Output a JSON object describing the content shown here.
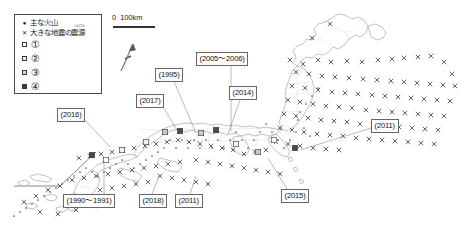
{
  "legend": {
    "title_hidden": "",
    "items": [
      {
        "symbol": "dot",
        "icon": "volcano-dot-icon",
        "label": "主な火山",
        "furigana": ""
      },
      {
        "symbol": "cross",
        "icon": "earthquake-cross-icon",
        "label": "大きな地震の震源",
        "furigana": "しんげん"
      }
    ],
    "ranks": [
      {
        "icon": "square-rank-1-icon",
        "label": "①",
        "fill": "#ffffff"
      },
      {
        "icon": "square-rank-2-icon",
        "label": "②",
        "fill": "#f2f2f2"
      },
      {
        "icon": "square-rank-3-icon",
        "label": "③",
        "fill": "#d8d8d8"
      },
      {
        "icon": "square-rank-4-icon",
        "label": "④",
        "fill": "#3a3a3a"
      }
    ]
  },
  "scale": {
    "zero": "0",
    "distance": "100km"
  },
  "north_arrow": {
    "icon": "north-arrow-icon",
    "label": ""
  },
  "callouts": [
    {
      "id": "c2005",
      "label": "(2005〜2006)",
      "left": 196,
      "top": 52,
      "leader": {
        "x1": 231,
        "y1": 63,
        "x2": 231,
        "y2": 131
      }
    },
    {
      "id": "c1995",
      "label": "(1995)",
      "left": 155,
      "top": 68,
      "leader": {
        "x1": 173,
        "y1": 79,
        "x2": 196,
        "y2": 133
      }
    },
    {
      "id": "c2014",
      "label": "(2014)",
      "left": 229,
      "top": 86,
      "leader": {
        "x1": 241,
        "y1": 97,
        "x2": 228,
        "y2": 134
      }
    },
    {
      "id": "c2017",
      "label": "(2017)",
      "left": 136,
      "top": 94,
      "leader": {
        "x1": 162,
        "y1": 105,
        "x2": 178,
        "y2": 132
      }
    },
    {
      "id": "c2016",
      "label": "(2016)",
      "left": 57,
      "top": 108,
      "leader": {
        "x1": 84,
        "y1": 119,
        "x2": 110,
        "y2": 147
      }
    },
    {
      "id": "c2011r",
      "label": "(2011)",
      "left": 371,
      "top": 119,
      "leader": {
        "x1": 371,
        "y1": 128,
        "x2": 300,
        "y2": 150
      }
    },
    {
      "id": "c1990",
      "label": "(1990〜1991)",
      "left": 63,
      "top": 194,
      "leader": {
        "x1": 104,
        "y1": 194,
        "x2": 104,
        "y2": 162
      }
    },
    {
      "id": "c2018",
      "label": "(2018)",
      "left": 139,
      "top": 194,
      "leader": {
        "x1": 152,
        "y1": 194,
        "x2": 159,
        "y2": 176
      }
    },
    {
      "id": "c2011b",
      "label": "(2011)",
      "left": 175,
      "top": 194,
      "leader": {
        "x1": 190,
        "y1": 194,
        "x2": 196,
        "y2": 176
      }
    },
    {
      "id": "c2015",
      "label": "(2015)",
      "left": 281,
      "top": 189,
      "leader": {
        "x1": 287,
        "y1": 189,
        "x2": 268,
        "y2": 158
      }
    }
  ],
  "colors": {
    "coastline": "#8a8a8a",
    "prefecture_border": "#a8a8a8",
    "quake_mark": "#333333",
    "volcano_mark": "#555555",
    "label_border": "#666666",
    "background": "#ffffff"
  },
  "map_data": {
    "type": "thematic-point-map",
    "region": "Japan",
    "earthquake_epicenters": [
      [
        330,
        24
      ],
      [
        312,
        38
      ],
      [
        290,
        60
      ],
      [
        303,
        64
      ],
      [
        318,
        60
      ],
      [
        331,
        62
      ],
      [
        347,
        61
      ],
      [
        362,
        62
      ],
      [
        378,
        60
      ],
      [
        392,
        59
      ],
      [
        404,
        58
      ],
      [
        418,
        57
      ],
      [
        431,
        56
      ],
      [
        444,
        62
      ],
      [
        452,
        74
      ],
      [
        296,
        72
      ],
      [
        309,
        74
      ],
      [
        322,
        76
      ],
      [
        335,
        77
      ],
      [
        349,
        78
      ],
      [
        363,
        79
      ],
      [
        377,
        80
      ],
      [
        391,
        81
      ],
      [
        404,
        82
      ],
      [
        417,
        83
      ],
      [
        430,
        84
      ],
      [
        443,
        85
      ],
      [
        455,
        86
      ],
      [
        292,
        86
      ],
      [
        305,
        88
      ],
      [
        318,
        90
      ],
      [
        332,
        92
      ],
      [
        345,
        93
      ],
      [
        358,
        94
      ],
      [
        372,
        95
      ],
      [
        385,
        96
      ],
      [
        398,
        97
      ],
      [
        411,
        98
      ],
      [
        424,
        99
      ],
      [
        437,
        100
      ],
      [
        450,
        101
      ],
      [
        288,
        100
      ],
      [
        300,
        102
      ],
      [
        313,
        104
      ],
      [
        326,
        106
      ],
      [
        339,
        107
      ],
      [
        352,
        108
      ],
      [
        366,
        110
      ],
      [
        379,
        111
      ],
      [
        392,
        112
      ],
      [
        405,
        113
      ],
      [
        418,
        114
      ],
      [
        431,
        115
      ],
      [
        444,
        116
      ],
      [
        284,
        114
      ],
      [
        296,
        116
      ],
      [
        308,
        118
      ],
      [
        321,
        120
      ],
      [
        334,
        121
      ],
      [
        347,
        122
      ],
      [
        360,
        124
      ],
      [
        373,
        125
      ],
      [
        386,
        126
      ],
      [
        399,
        127
      ],
      [
        412,
        128
      ],
      [
        425,
        129
      ],
      [
        438,
        130
      ],
      [
        280,
        128
      ],
      [
        292,
        130
      ],
      [
        304,
        132
      ],
      [
        317,
        134
      ],
      [
        330,
        135
      ],
      [
        343,
        136
      ],
      [
        356,
        138
      ],
      [
        369,
        139
      ],
      [
        382,
        140
      ],
      [
        395,
        141
      ],
      [
        408,
        142
      ],
      [
        421,
        143
      ],
      [
        434,
        144
      ],
      [
        276,
        142
      ],
      [
        288,
        144
      ],
      [
        300,
        146
      ],
      [
        313,
        148
      ],
      [
        326,
        149
      ],
      [
        339,
        150
      ],
      [
        266,
        150
      ],
      [
        255,
        152
      ],
      [
        244,
        154
      ],
      [
        233,
        150
      ],
      [
        222,
        148
      ],
      [
        211,
        146
      ],
      [
        200,
        144
      ],
      [
        189,
        142
      ],
      [
        178,
        140
      ],
      [
        167,
        142
      ],
      [
        156,
        144
      ],
      [
        145,
        146
      ],
      [
        134,
        148
      ],
      [
        123,
        150
      ],
      [
        112,
        152
      ],
      [
        101,
        154
      ],
      [
        90,
        156
      ],
      [
        79,
        158
      ],
      [
        196,
        160
      ],
      [
        208,
        162
      ],
      [
        220,
        164
      ],
      [
        232,
        166
      ],
      [
        244,
        168
      ],
      [
        256,
        170
      ],
      [
        268,
        172
      ],
      [
        280,
        174
      ],
      [
        180,
        162
      ],
      [
        168,
        164
      ],
      [
        156,
        166
      ],
      [
        144,
        168
      ],
      [
        132,
        170
      ],
      [
        120,
        172
      ],
      [
        108,
        174
      ],
      [
        96,
        176
      ],
      [
        84,
        178
      ],
      [
        72,
        180
      ],
      [
        160,
        176
      ],
      [
        172,
        178
      ],
      [
        184,
        180
      ],
      [
        196,
        182
      ],
      [
        208,
        184
      ],
      [
        148,
        182
      ],
      [
        136,
        184
      ],
      [
        124,
        186
      ],
      [
        112,
        188
      ],
      [
        100,
        190
      ],
      [
        60,
        186
      ],
      [
        48,
        190
      ],
      [
        36,
        196
      ],
      [
        24,
        202
      ],
      [
        40,
        212
      ],
      [
        58,
        214
      ],
      [
        76,
        210
      ],
      [
        94,
        206
      ],
      [
        112,
        204
      ],
      [
        66,
        200
      ],
      [
        84,
        198
      ],
      [
        102,
        196
      ]
    ],
    "volcanoes": [
      [
        318,
        88
      ],
      [
        312,
        96
      ],
      [
        306,
        104
      ],
      [
        300,
        112
      ],
      [
        298,
        120
      ],
      [
        304,
        128
      ],
      [
        310,
        136
      ],
      [
        296,
        132
      ],
      [
        290,
        140
      ],
      [
        284,
        148
      ],
      [
        278,
        140
      ],
      [
        272,
        132
      ],
      [
        266,
        124
      ],
      [
        260,
        132
      ],
      [
        254,
        140
      ],
      [
        248,
        148
      ],
      [
        242,
        140
      ],
      [
        236,
        132
      ],
      [
        230,
        140
      ],
      [
        224,
        148
      ],
      [
        218,
        140
      ],
      [
        212,
        148
      ],
      [
        206,
        140
      ],
      [
        200,
        148
      ],
      [
        194,
        140
      ],
      [
        188,
        148
      ],
      [
        182,
        140
      ],
      [
        176,
        148
      ],
      [
        170,
        140
      ],
      [
        164,
        148
      ],
      [
        158,
        152
      ],
      [
        152,
        156
      ],
      [
        146,
        160
      ],
      [
        140,
        164
      ],
      [
        134,
        168
      ],
      [
        128,
        164
      ],
      [
        122,
        160
      ],
      [
        116,
        164
      ],
      [
        110,
        168
      ],
      [
        104,
        172
      ],
      [
        98,
        176
      ],
      [
        92,
        172
      ],
      [
        86,
        168
      ],
      [
        80,
        172
      ],
      [
        74,
        176
      ],
      [
        68,
        180
      ],
      [
        62,
        184
      ],
      [
        56,
        188
      ],
      [
        50,
        192
      ],
      [
        44,
        196
      ],
      [
        38,
        200
      ],
      [
        32,
        204
      ],
      [
        26,
        208
      ],
      [
        20,
        212
      ],
      [
        14,
        216
      ]
    ],
    "rank_squares": [
      {
        "rank": 4,
        "x": 180,
        "y": 131
      },
      {
        "rank": 4,
        "x": 216,
        "y": 130
      },
      {
        "rank": 4,
        "x": 92,
        "y": 155
      },
      {
        "rank": 4,
        "x": 295,
        "y": 148
      },
      {
        "rank": 3,
        "x": 165,
        "y": 132
      },
      {
        "rank": 3,
        "x": 201,
        "y": 133
      },
      {
        "rank": 3,
        "x": 258,
        "y": 152
      },
      {
        "rank": 2,
        "x": 146,
        "y": 142
      },
      {
        "rank": 2,
        "x": 122,
        "y": 150
      },
      {
        "rank": 2,
        "x": 236,
        "y": 144
      },
      {
        "rank": 1,
        "x": 106,
        "y": 160
      },
      {
        "rank": 1,
        "x": 274,
        "y": 140
      }
    ]
  }
}
